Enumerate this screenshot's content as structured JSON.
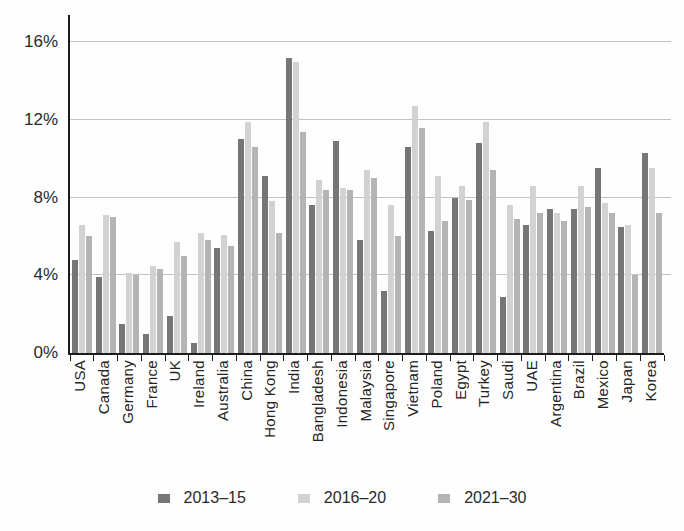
{
  "chart_data": {
    "type": "bar",
    "title": "",
    "xlabel": "",
    "ylabel": "",
    "y_ticks": [
      {
        "value": 0,
        "label": "0%"
      },
      {
        "value": 4,
        "label": "4%"
      },
      {
        "value": 8,
        "label": "8%"
      },
      {
        "value": 12,
        "label": "12%"
      },
      {
        "value": 16,
        "label": "16%"
      }
    ],
    "ylim": [
      0,
      17.4
    ],
    "grid": true,
    "legend_position": "bottom",
    "categories": [
      "USA",
      "Canada",
      "Germany",
      "France",
      "UK",
      "Ireland",
      "Australia",
      "China",
      "Hong Kong",
      "India",
      "Bangladesh",
      "Indonesia",
      "Malaysia",
      "Singapore",
      "Vietnam",
      "Poland",
      "Egypt",
      "Turkey",
      "Saudi",
      "UAE",
      "Argentina",
      "Brazil",
      "Mexico",
      "Japan",
      "Korea"
    ],
    "series": [
      {
        "name": "2013–15",
        "color": "#767676",
        "values": [
          4.8,
          3.9,
          1.5,
          1.0,
          1.9,
          0.5,
          5.4,
          11.0,
          9.1,
          15.2,
          7.6,
          10.9,
          5.8,
          3.2,
          10.6,
          6.3,
          8.0,
          10.8,
          2.9,
          6.6,
          7.4,
          7.4,
          9.5,
          6.5,
          10.3
        ]
      },
      {
        "name": "2016–20",
        "color": "#d2d2d2",
        "values": [
          6.6,
          7.1,
          4.1,
          4.5,
          5.7,
          6.2,
          6.1,
          11.9,
          7.8,
          15.0,
          8.9,
          8.5,
          9.4,
          7.6,
          12.7,
          9.1,
          8.6,
          11.9,
          7.6,
          8.6,
          7.2,
          8.6,
          7.7,
          6.6,
          9.5
        ]
      },
      {
        "name": "2021–30",
        "color": "#b4b4b4",
        "values": [
          6.0,
          7.0,
          4.0,
          4.3,
          5.0,
          5.8,
          5.5,
          10.6,
          6.2,
          11.4,
          8.4,
          8.4,
          9.0,
          6.0,
          11.6,
          6.8,
          7.9,
          9.4,
          6.9,
          7.2,
          6.8,
          7.5,
          7.2,
          4.0,
          7.2
        ]
      }
    ]
  },
  "colors": {
    "axis": "#1c1c1c",
    "gridline": "#c3c3c3",
    "text": "#2a2a2a",
    "background": "#fefefe"
  }
}
